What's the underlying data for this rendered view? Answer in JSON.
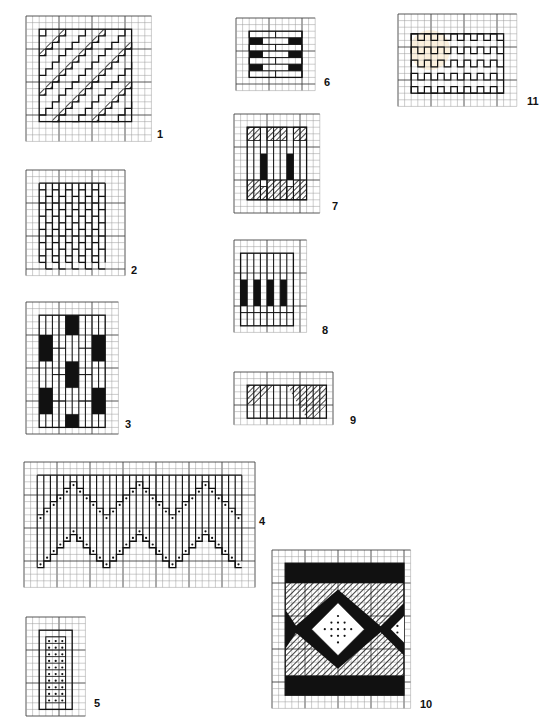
{
  "page": {
    "background": "#ffffff",
    "ink": "#111111",
    "grid_color": "#9a9a9a",
    "grid_major_color": "#444444"
  },
  "diagrams": [
    {
      "id": 1,
      "label": "1",
      "pattern": "diagonal-stepped-bands",
      "description": "Diagonal stepped stripes with hatched stitches"
    },
    {
      "id": 2,
      "label": "2",
      "pattern": "brick-vertical",
      "description": "Vertical brick stitch columns"
    },
    {
      "id": 3,
      "label": "3",
      "pattern": "vertical-blocks-solid",
      "description": "Vertical stitches with staggered solid blocks"
    },
    {
      "id": 4,
      "label": "4",
      "pattern": "zigzag-bargello",
      "description": "Bargello zigzag border with dotted outline rows"
    },
    {
      "id": 5,
      "label": "5",
      "pattern": "dotted-column",
      "description": "Narrow column filled with dotted stitches"
    },
    {
      "id": 6,
      "label": "6",
      "pattern": "horizontal-brick-solid",
      "description": "Horizontal brick stitches with solid end blocks"
    },
    {
      "id": 7,
      "label": "7",
      "pattern": "hatched-vertical",
      "description": "Vertical stitches with hatched and solid accents"
    },
    {
      "id": 8,
      "label": "8",
      "pattern": "vertical-solid-bars",
      "description": "Vertical stitches with four solid bars"
    },
    {
      "id": 9,
      "label": "9",
      "pattern": "hatched-strip",
      "description": "Short strip with diagonal hatched triangles"
    },
    {
      "id": 10,
      "label": "10",
      "pattern": "diamond-band",
      "description": "Band with solid borders, hatched fill and dotted diamond"
    },
    {
      "id": 11,
      "label": "11",
      "pattern": "meander-rows",
      "description": "Rows of square-wave meander stitches"
    }
  ]
}
